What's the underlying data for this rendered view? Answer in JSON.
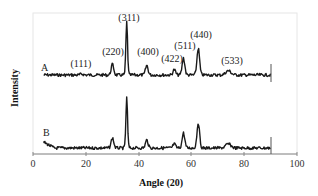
{
  "chart_data": {
    "type": "line",
    "title": "",
    "xlabel": "Angle (2θ)",
    "xlabel_display": "Angle (20)",
    "ylabel": "Intensity",
    "xlim": [
      0,
      100
    ],
    "xticks": [
      0,
      20,
      40,
      60,
      80,
      100
    ],
    "yticks": [],
    "grid": false,
    "legend": "none (inline labels A and B)",
    "series": [
      {
        "name": "A",
        "label_position": [
          3,
          0.83
        ],
        "x_range": [
          4,
          90
        ],
        "baseline": 0.0,
        "peaks": [
          {
            "hkl": "(111)",
            "x": 18.5,
            "height": 0.02
          },
          {
            "hkl": "(220)",
            "x": 30.1,
            "height": 0.2
          },
          {
            "hkl": "(311)",
            "x": 35.5,
            "height": 1.0
          },
          {
            "hkl": "(400)",
            "x": 43.1,
            "height": 0.18
          },
          {
            "hkl": "(422)",
            "x": 53.5,
            "height": 0.1
          },
          {
            "hkl": "(511)",
            "x": 57.0,
            "height": 0.32
          },
          {
            "hkl": "(440)",
            "x": 62.6,
            "height": 0.5
          },
          {
            "hkl": "(533)",
            "x": 74.0,
            "height": 0.08
          }
        ]
      },
      {
        "name": "B",
        "label_position": [
          3,
          0.28
        ],
        "x_range": [
          4,
          90
        ],
        "baseline": 0.0,
        "peaks": [
          {
            "hkl": "(220)",
            "x": 30.1,
            "height": 0.2
          },
          {
            "hkl": "(311)",
            "x": 35.5,
            "height": 1.0
          },
          {
            "hkl": "(400)",
            "x": 43.1,
            "height": 0.16
          },
          {
            "hkl": "(422)",
            "x": 53.5,
            "height": 0.08
          },
          {
            "hkl": "(511)",
            "x": 57.0,
            "height": 0.3
          },
          {
            "hkl": "(440)",
            "x": 62.6,
            "height": 0.5
          },
          {
            "hkl": "(533)",
            "x": 74.0,
            "height": 0.08
          }
        ]
      }
    ],
    "annotations": [
      "(111)",
      "(220)",
      "(311)",
      "(400)",
      "(422)",
      "(511)",
      "(440)",
      "(533)"
    ]
  },
  "labels": {
    "series_a": "A",
    "series_b": "B",
    "x_axis_title": "Angle (20)",
    "y_axis_title": "Intensity",
    "ticks": [
      "0",
      "20",
      "40",
      "60",
      "80",
      "100"
    ],
    "peak_111": "(111)",
    "peak_220": "(220)",
    "peak_311": "(311)",
    "peak_400": "(400)",
    "peak_422": "(422)",
    "peak_511": "(511)",
    "peak_440": "(440)",
    "peak_533": "(533)"
  },
  "colors": {
    "trace": "#1a1a1a",
    "frame": "#e6e6e6",
    "axis": "#888888"
  }
}
